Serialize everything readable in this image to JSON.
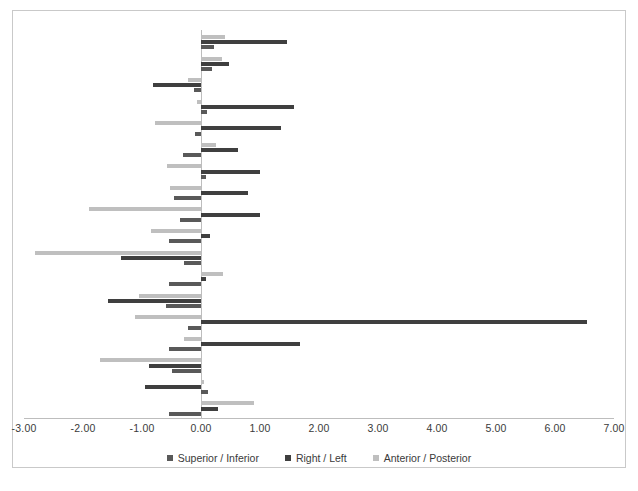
{
  "chart_data": {
    "type": "bar",
    "orientation": "horizontal",
    "title": "",
    "xlabel": "",
    "ylabel": "",
    "xlim": [
      -3.0,
      7.0
    ],
    "grid": false,
    "legend_position": "bottom",
    "xticks": [
      "-3.00",
      "-2.00",
      "-1.00",
      "0.00",
      "1.00",
      "2.00",
      "3.00",
      "4.00",
      "5.00",
      "6.00",
      "7.00"
    ],
    "xtick_values": [
      -3,
      -2,
      -1,
      0,
      1,
      2,
      3,
      4,
      5,
      6,
      7
    ],
    "categories": [
      "1",
      "2",
      "3",
      "4",
      "5",
      "6",
      "7",
      "8",
      "9",
      "10",
      "11",
      "12",
      "13",
      "14",
      "15",
      "16",
      "17",
      "18"
    ],
    "series": [
      {
        "name": "Superior / Inferior",
        "color": "#595959",
        "values": [
          0.22,
          0.18,
          -0.12,
          0.1,
          -0.1,
          -0.3,
          0.08,
          -0.45,
          -0.35,
          -0.55,
          -0.28,
          -0.55,
          -0.6,
          -0.22,
          -0.55,
          -0.5,
          0.12,
          -0.55
        ]
      },
      {
        "name": "Right / Left",
        "color": "#3f3f3f",
        "values": [
          1.46,
          0.47,
          -0.82,
          1.58,
          1.35,
          0.62,
          1.0,
          0.8,
          1.0,
          0.15,
          -1.35,
          0.08,
          -1.58,
          6.55,
          1.68,
          -0.88,
          -0.95,
          0.28
        ]
      },
      {
        "name": "Anterior / Posterior",
        "color": "#bfbfbf",
        "values": [
          0.4,
          0.35,
          -0.22,
          -0.06,
          -0.78,
          0.25,
          -0.58,
          -0.52,
          -1.9,
          -0.85,
          -2.82,
          0.38,
          -1.05,
          -1.12,
          -0.28,
          -1.72,
          0.05,
          0.9
        ]
      }
    ]
  }
}
